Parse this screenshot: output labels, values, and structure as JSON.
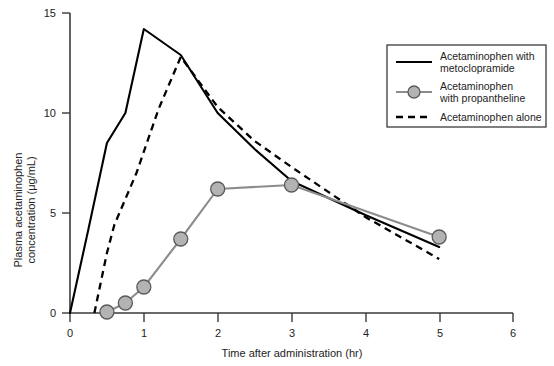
{
  "chart_data": {
    "type": "line",
    "title": "",
    "xlabel": "Time after administration (hr)",
    "ylabel": "Plasma acetaminophen concentration (μg/mL)",
    "ylabel_line1": "Plasma acetaminophen",
    "ylabel_line2": "concentration (μg/mL)",
    "xlim": [
      0,
      6
    ],
    "ylim": [
      0,
      15
    ],
    "xticks": [
      "0",
      "1",
      "2",
      "3",
      "4",
      "5",
      "6"
    ],
    "xtick_values": [
      0,
      1,
      2,
      3,
      4,
      5,
      6
    ],
    "yticks": [
      "0",
      "5",
      "10",
      "15"
    ],
    "ytick_values": [
      0,
      5,
      10,
      15
    ],
    "grid": false,
    "legend_position": "top-right",
    "series": [
      {
        "name": "Acetaminophen with metoclopramide",
        "legend_line1": "Acetaminophen with",
        "legend_line2": "metoclopramide",
        "style": "solid",
        "color": "#000000",
        "markers": false,
        "x": [
          0.0,
          0.25,
          0.5,
          0.75,
          1.0,
          1.5,
          2.0,
          2.5,
          3.0,
          4.0,
          5.0
        ],
        "y": [
          0.0,
          4.2,
          8.5,
          10.0,
          14.2,
          12.9,
          10.0,
          8.2,
          6.6,
          4.9,
          3.3
        ]
      },
      {
        "name": "Acetaminophen with propantheline",
        "legend_line1": "Acetaminophen",
        "legend_line2": "with propantheline",
        "style": "solid-markers",
        "color": "#8c8c8c",
        "marker_fill": "#b3b3b3",
        "marker_edge": "#5a5a5a",
        "markers": true,
        "x": [
          0.5,
          0.75,
          1.0,
          1.5,
          2.0,
          3.0,
          5.0
        ],
        "y": [
          0.05,
          0.5,
          1.3,
          3.7,
          6.2,
          6.4,
          3.8
        ]
      },
      {
        "name": "Acetaminophen alone",
        "legend_line1": "Acetaminophen alone",
        "legend_line2": "",
        "style": "dashed",
        "color": "#000000",
        "markers": false,
        "x": [
          0.33,
          0.5,
          0.6,
          0.9,
          1.2,
          1.5,
          2.0,
          2.5,
          3.0,
          4.0,
          5.0
        ],
        "y": [
          0.0,
          3.0,
          4.4,
          7.0,
          10.2,
          12.8,
          10.3,
          8.6,
          7.3,
          4.8,
          2.7
        ]
      }
    ]
  }
}
